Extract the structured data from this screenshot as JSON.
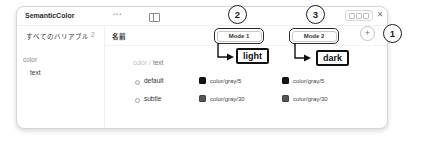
{
  "panel": {
    "title": "SemanticColor",
    "menu_label": "•••",
    "close_label": "✕"
  },
  "sidebar": {
    "all_variables_label": "すべてのバリアブル",
    "count": "2",
    "group": "color",
    "item": "text"
  },
  "table": {
    "name_header": "名前",
    "group_prefix": "color",
    "group_separator": "/",
    "group_name": "text",
    "modes": [
      {
        "label": "Mode 1"
      },
      {
        "label": "Mode 2"
      }
    ],
    "add_mode_label": "+",
    "rows": [
      {
        "name": "default",
        "values": [
          {
            "swatch": "#141414",
            "label": "color/gray/5"
          },
          {
            "swatch": "#141414",
            "label": "color/gray/5"
          }
        ]
      },
      {
        "name": "subtle",
        "values": [
          {
            "swatch": "#565656",
            "label": "color/gray/30"
          },
          {
            "swatch": "#565656",
            "label": "color/gray/30"
          }
        ]
      }
    ]
  },
  "annotations": {
    "accent_color": "#111111",
    "steps": [
      {
        "number": "1"
      },
      {
        "number": "2",
        "label": "light"
      },
      {
        "number": "3",
        "label": "dark"
      }
    ]
  }
}
